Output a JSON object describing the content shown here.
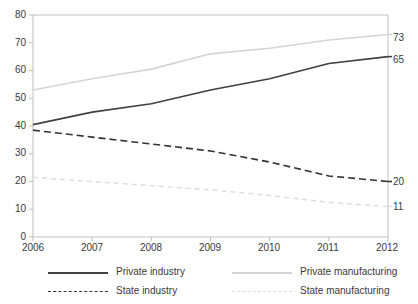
{
  "chart_data": {
    "type": "line",
    "title": "",
    "subtitle": "",
    "xlabel": "",
    "ylabel": "",
    "x": [
      2006,
      2007,
      2008,
      2009,
      2010,
      2011,
      2012
    ],
    "xtick_labels": [
      "2006",
      "2007",
      "2008",
      "2009",
      "2010",
      "2011",
      "2012"
    ],
    "ytick_labels": [
      "0",
      "10",
      "20",
      "30",
      "40",
      "50",
      "60",
      "70",
      "80"
    ],
    "ytick_values": [
      0,
      10,
      20,
      30,
      40,
      50,
      60,
      70,
      80
    ],
    "ylim": [
      0,
      80
    ],
    "xlim": [
      2006,
      2012
    ],
    "grid": false,
    "legend_position": "bottom",
    "series": [
      {
        "name": "Private industry",
        "values": [
          40.5,
          45,
          48,
          53,
          57,
          62.5,
          65
        ],
        "end_label": "65",
        "color": "#404040",
        "style": "solid",
        "width": 1.6
      },
      {
        "name": "Private manufacturing",
        "values": [
          53,
          57,
          60.5,
          66,
          68,
          71,
          73
        ],
        "end_label": "73",
        "color": "#d4d4d4",
        "style": "solid",
        "width": 1.6
      },
      {
        "name": "State industry",
        "values": [
          38.5,
          36,
          33.5,
          31,
          27,
          22,
          20
        ],
        "end_label": "20",
        "color": "#333333",
        "style": "dashed",
        "width": 1.6
      },
      {
        "name": "State manufacturing",
        "values": [
          21.5,
          20,
          18.5,
          17,
          15,
          12.5,
          11
        ],
        "end_label": "11",
        "color": "#dcdcdc",
        "style": "dotted",
        "width": 1.4
      }
    ]
  },
  "legend": {
    "items": [
      {
        "label": "Private industry",
        "color": "#404040",
        "style": "solid"
      },
      {
        "label": "Private manufacturing",
        "color": "#d4d4d4",
        "style": "solid"
      },
      {
        "label": "State industry",
        "color": "#333333",
        "style": "dashed"
      },
      {
        "label": "State manufacturing",
        "color": "#dcdcdc",
        "style": "dotted"
      }
    ]
  },
  "axes": {
    "axis_color": "#bfbfbf",
    "plot_left": 33,
    "plot_right": 388,
    "plot_top": 15,
    "plot_bottom": 237
  }
}
